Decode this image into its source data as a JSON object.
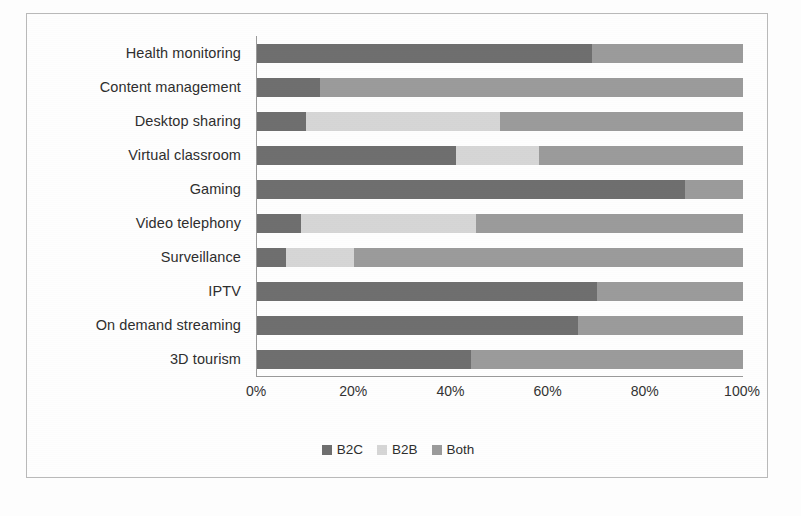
{
  "chart_data": {
    "type": "bar",
    "subtype": "stacked-horizontal-100",
    "title": "",
    "subtitle": "",
    "xlabel": "",
    "ylabel": "",
    "xlim": [
      0,
      100
    ],
    "grid": false,
    "legend_position": "bottom-center",
    "x_ticks": [
      "0%",
      "20%",
      "40%",
      "60%",
      "80%",
      "100%"
    ],
    "x_tick_values": [
      0,
      20,
      40,
      60,
      80,
      100
    ],
    "categories": [
      "Health monitoring",
      "Content management",
      "Desktop sharing",
      "Virtual classroom",
      "Gaming",
      "Video telephony",
      "Surveillance",
      "IPTV",
      "On demand streaming",
      "3D tourism"
    ],
    "series": [
      {
        "name": "B2C",
        "color": "#6f6f6f",
        "values": [
          69,
          13,
          10,
          41,
          88,
          9,
          6,
          70,
          66,
          44
        ]
      },
      {
        "name": "B2B",
        "color": "#d6d6d6",
        "values": [
          0,
          0,
          40,
          17,
          0,
          36,
          14,
          0,
          0,
          0
        ]
      },
      {
        "name": "Both",
        "color": "#9b9b9b",
        "values": [
          31,
          87,
          50,
          42,
          12,
          55,
          80,
          30,
          34,
          56
        ]
      }
    ]
  },
  "legend": {
    "items": [
      {
        "label": "B2C",
        "color": "#6f6f6f"
      },
      {
        "label": "B2B",
        "color": "#d6d6d6"
      },
      {
        "label": "Both",
        "color": "#9b9b9b"
      }
    ]
  },
  "colors": {
    "b2c": "#6f6f6f",
    "b2b": "#d6d6d6",
    "both": "#9b9b9b",
    "axis": "#9a9a9a",
    "frame": "#b9b9b9",
    "text": "#2e2e2e",
    "background": "#fefefe"
  }
}
